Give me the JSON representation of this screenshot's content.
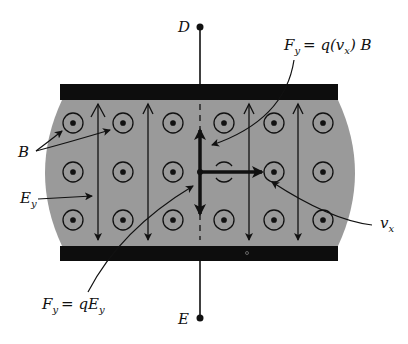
{
  "diagram": {
    "colors": {
      "background": "#ffffff",
      "region_fill": "#9a9a9a",
      "plate": "#0d0d0d",
      "ink": "#111111"
    },
    "terminals": {
      "top": {
        "label": "D"
      },
      "bottom": {
        "label": "E"
      }
    },
    "labels": {
      "magnetic_field": "B",
      "electric_field": {
        "main": "E",
        "sub": "y"
      },
      "velocity": {
        "main": "v",
        "sub": "x"
      },
      "magnetic_force": {
        "lhs_main": "F",
        "lhs_sub": "y",
        "rhs_a": "= q(v",
        "rhs_sub": "x",
        "rhs_b": ") B"
      },
      "electric_force": {
        "lhs_main": "F",
        "lhs_sub": "y",
        "rhs_main": "= qE",
        "rhs_sub": "y"
      }
    },
    "field_symbols": {
      "type": "B out of page (dot-in-circle)",
      "columns_x": [
        73,
        123,
        173,
        224,
        274,
        323
      ],
      "rows_y": [
        123,
        172,
        220
      ]
    },
    "field_lines_x": [
      98,
      148,
      249,
      298
    ]
  }
}
